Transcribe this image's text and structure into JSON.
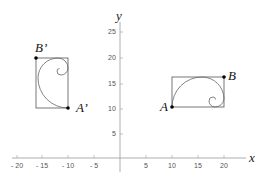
{
  "diagram": {
    "type": "coordinate-plane-transformation",
    "axes": {
      "x_label": "x",
      "y_label": "y",
      "x_ticks": [
        {
          "value": -20,
          "label": "- 20"
        },
        {
          "value": -15,
          "label": "- 15"
        },
        {
          "value": -10,
          "label": "- 10"
        },
        {
          "value": -5,
          "label": "- 5"
        },
        {
          "value": 5,
          "label": "5"
        },
        {
          "value": 10,
          "label": "10"
        },
        {
          "value": 15,
          "label": "15"
        },
        {
          "value": 20,
          "label": "20"
        }
      ],
      "y_ticks": [
        {
          "value": 5,
          "label": "5"
        },
        {
          "value": 10,
          "label": "10"
        },
        {
          "value": 15,
          "label": "15"
        },
        {
          "value": 20,
          "label": "20"
        },
        {
          "value": 25,
          "label": "25"
        }
      ]
    },
    "figures": [
      {
        "name": "original",
        "rectangle": {
          "x_min": 10,
          "x_max": 20,
          "y_min": 10,
          "y_max": 16
        },
        "curve": "golden spiral",
        "points": [
          {
            "label": "A",
            "x": 10,
            "y": 10
          },
          {
            "label": "B",
            "x": 20,
            "y": 16
          }
        ]
      },
      {
        "name": "image",
        "rectangle": {
          "x_min": -16,
          "x_max": -10,
          "y_min": 10,
          "y_max": 20
        },
        "curve": "golden spiral (rotated 90°)",
        "points": [
          {
            "label": "A’",
            "x": -10,
            "y": 10
          },
          {
            "label": "B’",
            "x": -16,
            "y": 20
          }
        ]
      }
    ],
    "colors": {
      "axis": "#9a9a9a",
      "rectangle": "#555555",
      "spiral": "#666666",
      "point": "#000000"
    }
  }
}
